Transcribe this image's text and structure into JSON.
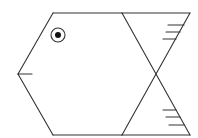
{
  "figure": {
    "stroke_color": "#333333",
    "background": "#ffffff",
    "parts": [
      {
        "name": "head-top-edge",
        "from": [
          53,
          13
        ],
        "to": [
          122,
          13
        ]
      },
      {
        "name": "head-upper-slant",
        "from": [
          53,
          13
        ],
        "to": [
          18,
          74
        ]
      },
      {
        "name": "head-lower-slant",
        "from": [
          18,
          74
        ],
        "to": [
          53,
          135
        ]
      },
      {
        "name": "body-bottom-edge",
        "from": [
          53,
          135
        ],
        "to": [
          122,
          135
        ]
      },
      {
        "name": "mouth",
        "from": [
          18,
          74
        ],
        "to": [
          32,
          74
        ]
      },
      {
        "name": "eye",
        "center": [
          58,
          35
        ],
        "outer_radius": 7,
        "pupil_radius": 3
      },
      {
        "name": "tail-top-edge",
        "from": [
          122,
          13
        ],
        "to": [
          190,
          13
        ]
      },
      {
        "name": "tail-bottom-edge",
        "from": [
          122,
          135
        ],
        "to": [
          190,
          135
        ]
      },
      {
        "name": "body-diagonal-1",
        "from": [
          122,
          13
        ],
        "to": [
          190,
          135
        ]
      },
      {
        "name": "body-diagonal-2",
        "from": [
          190,
          13
        ],
        "to": [
          122,
          135
        ]
      },
      {
        "name": "upper-tail-fin-lines",
        "count": 3
      },
      {
        "name": "lower-tail-fin-lines",
        "count": 3
      }
    ]
  }
}
